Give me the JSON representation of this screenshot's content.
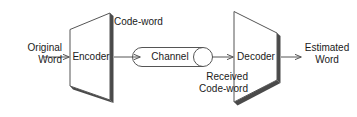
{
  "diagram": {
    "colors": {
      "stroke": "#555555",
      "shadow": "#4a4a4a",
      "text": "#1a1a1a",
      "background": "#ffffff",
      "arrow": "#555555"
    },
    "nodes": [
      {
        "id": "encoder",
        "label": "Encoder",
        "shape": "trapezoid-right"
      },
      {
        "id": "channel",
        "label": "Channel",
        "shape": "cylinder"
      },
      {
        "id": "decoder",
        "label": "Decoder",
        "shape": "trapezoid-left"
      }
    ],
    "labels": {
      "original_word": "Original\nWord",
      "code_word": "Code-word",
      "received_code_word": "Received\nCode-word",
      "estimated_word": "Estimated\nWord"
    },
    "flow": [
      {
        "from": "original-word",
        "to": "encoder",
        "label": ""
      },
      {
        "from": "encoder",
        "to": "channel",
        "label": "Code-word"
      },
      {
        "from": "channel",
        "to": "decoder",
        "label": "Received Code-word"
      },
      {
        "from": "decoder",
        "to": "estimated-word",
        "label": ""
      }
    ]
  }
}
